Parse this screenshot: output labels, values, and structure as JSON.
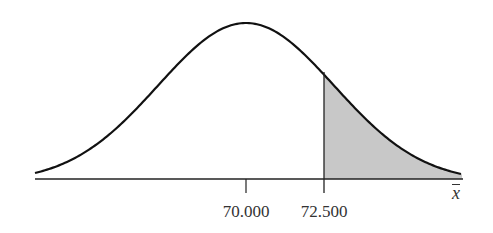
{
  "chart_data": {
    "type": "area",
    "title": "",
    "xlabel": "x̄",
    "ylabel": "",
    "tick_labels": [
      "70.000",
      "72.500"
    ],
    "mean": 70.0,
    "cutoff": 72.5,
    "shaded_region": "right tail (x̄ > 72.500)",
    "grid": false,
    "legend": null,
    "colors": {
      "curve": "#111111",
      "shade": "#c8c8c8",
      "axis": "#222222"
    }
  },
  "labels": {
    "mean_label": "70.000",
    "cutoff_label": "72.500",
    "axis_label": "x"
  }
}
